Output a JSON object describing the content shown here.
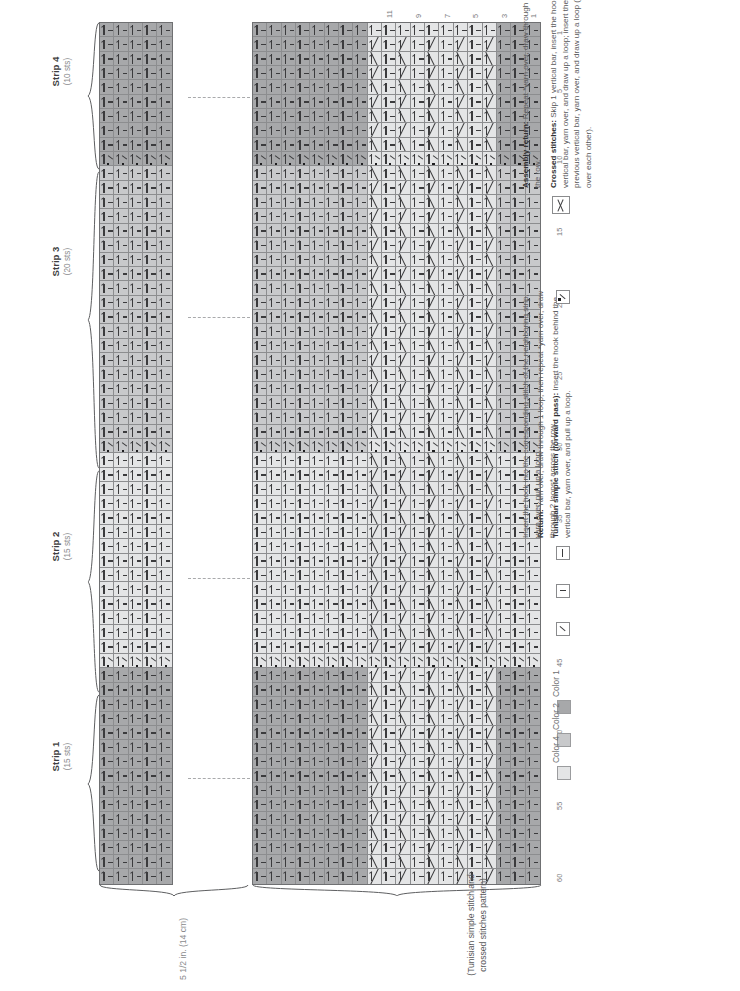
{
  "document": {
    "type": "crochet-stitch-chart",
    "orientation": "rotated-90-ccw"
  },
  "strips": [
    {
      "name": "Strip 4",
      "sts": "(10 sts)",
      "color": "c1"
    },
    {
      "name": "Strip 3",
      "sts": "(20 sts)",
      "color": "c2"
    },
    {
      "name": "Strip 2",
      "sts": "(15 sts)",
      "color": "c4"
    },
    {
      "name": "Strip 1",
      "sts": "(15 sts)",
      "color": "c1"
    }
  ],
  "chart_data": {
    "type": "table",
    "rows_total": 60,
    "row_tick_labels": [
      "1",
      "5",
      "10",
      "15",
      "20",
      "25",
      "30",
      "35",
      "40",
      "45",
      "50",
      "55",
      "60"
    ],
    "row_ticks": [
      1,
      5,
      10,
      15,
      20,
      25,
      30,
      35,
      40,
      45,
      50,
      55,
      60
    ],
    "left_block_columns": 5,
    "right_block_columns": 20,
    "column_tick_labels": [
      "11",
      "9",
      "7",
      "5",
      "3",
      "1"
    ],
    "column_ticks": [
      11,
      9,
      7,
      5,
      3,
      1
    ],
    "strip_row_spans": [
      {
        "name": "Strip 4",
        "start": 1,
        "end": 10,
        "sts": 10,
        "color": "c1"
      },
      {
        "name": "Strip 3",
        "start": 11,
        "end": 30,
        "sts": 20,
        "color": "c2"
      },
      {
        "name": "Strip 2",
        "start": 31,
        "end": 45,
        "sts": 15,
        "color": "c4"
      },
      {
        "name": "Strip 1",
        "start": 46,
        "end": 60,
        "sts": 15,
        "color": "c1"
      }
    ],
    "join_rows": [
      10,
      30,
      45
    ],
    "crossed_stitch_columns": [
      4,
      5,
      6,
      7,
      8,
      9,
      10,
      11,
      12
    ],
    "cell_symbols": [
      "tunisian-simple-stitch",
      "return",
      "assembly-return",
      "crossed-stitches"
    ]
  },
  "measurements": {
    "width_label": "5 1/2 in. (14 cm)",
    "pattern_label": "(Tunisian simple stitch and crossed stitches pattern)"
  },
  "legend": {
    "stitches": [
      {
        "symbol": "tunisian-simple-stitch",
        "bold": "Tunisian simple stitch (forward pass):",
        "text": " Insert the hook behind the vertical bar, yarn over, and pull up a loop."
      },
      {
        "symbol": "return",
        "bold": "Return:",
        "text": " Yarn over, draw through 1 loop, then repeat *yarn over, draw through 2 loops* across the row."
      },
      {
        "symbol": "assembly-stitch",
        "bold": "",
        "text": "Insert the hook into the corresponding stitch of the neighboring strip, yarn over, pull up a loop."
      },
      {
        "symbol": "crossed-stitches",
        "bold": "Crossed stitches:",
        "text": " Skip 1 vertical bar, insert the hook behind the next vertical bar, yarn over, and draw up a loop; insert the hook behind the previous vertical bar, yarn over, and draw up a loop (2 loops crossing over each other)."
      },
      {
        "symbol": "assembly-return",
        "bold": "Assembly return:",
        "text": " Repeat *yarn over, draw through 2 loops* across the row."
      }
    ],
    "colors": [
      {
        "label": "Color 1",
        "hex": "#a7a8aa"
      },
      {
        "label": "Color 2",
        "hex": "#c8c9cb"
      },
      {
        "label": "Color 4",
        "hex": "#e4e5e6"
      }
    ]
  }
}
